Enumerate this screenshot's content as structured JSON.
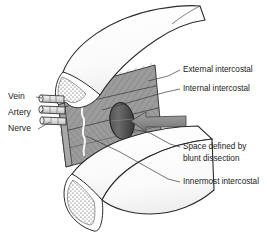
{
  "figure": {
    "background_color": "#ffffff",
    "ink_color": "#2b2b2b"
  },
  "labels": {
    "right": [
      {
        "id": "external-intercostal",
        "text": "External intercostal",
        "x": 183,
        "y": 70
      },
      {
        "id": "internal-intercostal",
        "text": "Internal intercostal",
        "x": 183,
        "y": 89
      },
      {
        "id": "space-blunt-dissection-line1",
        "text": "Space defined by",
        "x": 183,
        "y": 147
      },
      {
        "id": "space-blunt-dissection-line2",
        "text": "blunt dissection",
        "x": 183,
        "y": 159
      },
      {
        "id": "innermost-intercostal",
        "text": "Innermost intercostal",
        "x": 183,
        "y": 182
      }
    ],
    "left": [
      {
        "id": "vein",
        "text": "Vein",
        "x": 8,
        "y": 97
      },
      {
        "id": "artery",
        "text": "Artery",
        "x": 8,
        "y": 113
      },
      {
        "id": "nerve",
        "text": "Nerve",
        "x": 8,
        "y": 129
      }
    ]
  },
  "structures": {
    "rib_upper": {
      "name": "Upper rib",
      "fill": "#fdfdfd",
      "marrow_fill": "#ffffff"
    },
    "rib_lower": {
      "name": "Lower rib",
      "fill": "#fdfdfd",
      "marrow_fill": "#ffffff"
    },
    "muscle_block": {
      "name": "Intercostal muscle layers",
      "fill": "#9c9c9c",
      "hatch": "diagonal"
    },
    "dissection_space": {
      "name": "Space defined by blunt dissection",
      "fill": "#5d5d5d"
    },
    "arrow": {
      "name": "Dissection direction arrow",
      "fill": "#8c8c8c",
      "stroke": "#4a4a4a"
    },
    "neurovascular_bundle": {
      "name": "Vein artery nerve bundle",
      "fill": "#e8e8e8"
    },
    "membrane_line": {
      "name": "White dividing membrane line",
      "color": "#ffffff"
    }
  },
  "colors": {
    "muscle_gray": "#9c9c9c",
    "muscle_gray_dark": "#8a8a8a",
    "muscle_gray_light": "#b4b4b4",
    "bone_white": "#fdfdfd",
    "arrow_gray": "#8c8c8c",
    "ellipse_dark": "#5d5d5d",
    "outline": "#2b2b2b",
    "text": "#1a1a1a"
  }
}
